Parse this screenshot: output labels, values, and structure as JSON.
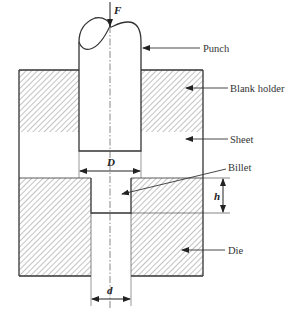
{
  "figure": {
    "type": "extrusion die schematic",
    "labels": {
      "force": "F",
      "punch": "Punch",
      "blank_holder": "Blank holder",
      "sheet": "Sheet",
      "billet": "Billet",
      "die": "Die",
      "punch_diameter": "D",
      "depth": "h",
      "hole_diameter": "d"
    },
    "colors": {
      "line": "#333333",
      "hatch": "#9a9a9a",
      "background": "#ffffff"
    }
  }
}
